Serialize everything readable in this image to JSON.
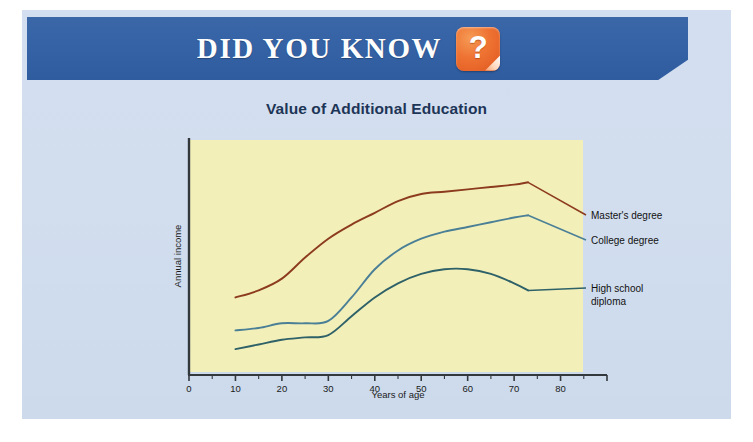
{
  "banner": {
    "title": "DID YOU KNOW",
    "icon": "question-mark-icon",
    "icon_glyph": "?",
    "background_color": "#3462a5"
  },
  "chart_data": {
    "type": "line",
    "title": "Value of Additional Education",
    "xlabel": "Years of age",
    "ylabel": "Annual income",
    "xlim": [
      0,
      90
    ],
    "ylim": [
      0,
      100
    ],
    "grid": false,
    "legend_position": "right-inline",
    "plot_background_color": "#f2efb9",
    "xticks": [
      0,
      10,
      20,
      30,
      40,
      50,
      60,
      70,
      80
    ],
    "xtick_labels": [
      "0",
      "10",
      "20",
      "30",
      "40",
      "50",
      "60",
      "70",
      "80"
    ],
    "ytick_labels": [],
    "series": [
      {
        "name": "Master's degree",
        "color": "#8c3b1e",
        "x": [
          10,
          15,
          20,
          25,
          30,
          35,
          40,
          45,
          50,
          55,
          60,
          65,
          70,
          73
        ],
        "values": [
          33,
          36,
          41,
          50,
          58,
          64,
          69,
          74,
          77,
          78,
          79,
          80,
          81,
          82
        ]
      },
      {
        "name": "College degree",
        "color": "#4a7f96",
        "x": [
          10,
          15,
          20,
          25,
          30,
          35,
          40,
          45,
          50,
          55,
          60,
          65,
          70,
          73
        ],
        "values": [
          19,
          20,
          22,
          22,
          23,
          33,
          45,
          53,
          58,
          61,
          63,
          65,
          67,
          68
        ]
      },
      {
        "name": "High school diploma",
        "color": "#2f6168",
        "x": [
          10,
          15,
          20,
          25,
          30,
          35,
          40,
          45,
          50,
          55,
          60,
          65,
          70,
          73
        ],
        "values": [
          11,
          13,
          15,
          16,
          17,
          25,
          33,
          39,
          43,
          45,
          45,
          43,
          39,
          36
        ]
      }
    ]
  }
}
